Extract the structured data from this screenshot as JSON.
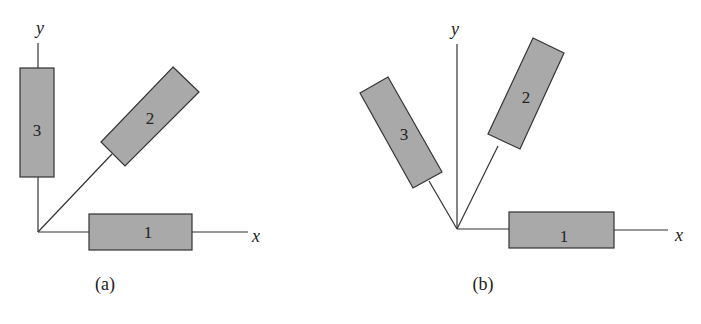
{
  "colors": {
    "bar_fill": "#a9a9a9",
    "stroke": "#333333",
    "background": "#ffffff"
  },
  "panels": [
    {
      "caption": "(a)",
      "axes": {
        "x_label": "x",
        "y_label": "y"
      },
      "bars": [
        {
          "label": "1",
          "orientation_deg": 0
        },
        {
          "label": "2",
          "orientation_deg": 45
        },
        {
          "label": "3",
          "orientation_deg": 90
        }
      ]
    },
    {
      "caption": "(b)",
      "axes": {
        "x_label": "x",
        "y_label": "y"
      },
      "bars": [
        {
          "label": "1",
          "orientation_deg": 0
        },
        {
          "label": "2",
          "orientation_deg": 64
        },
        {
          "label": "3",
          "orientation_deg": 120
        }
      ]
    }
  ]
}
